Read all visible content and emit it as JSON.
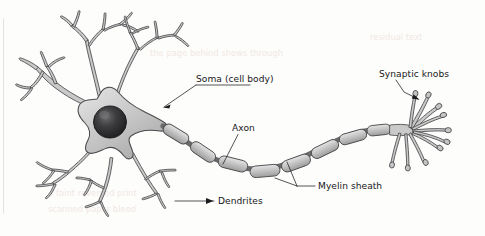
{
  "figure": {
    "background_color": "#fdfdfc",
    "ink_color": "#1b1b1f",
    "structure_fill": "#c9c9c9",
    "structure_outline": "#4a4a4d",
    "nucleus_color": "#262628"
  },
  "labels": {
    "soma": "Soma (cell body)",
    "axon": "Axon",
    "myelin": "Myelin sheath",
    "dendrites": "Dendrites",
    "synaptic_knobs": "Synaptic knobs"
  },
  "parts": [
    {
      "name": "soma",
      "label": "Soma (cell body)",
      "leader": "underline-then-line-down-left",
      "label_x": 196,
      "label_y": 82
    },
    {
      "name": "axon",
      "label": "Axon",
      "leader": "line-down-left",
      "label_x": 232,
      "label_y": 131
    },
    {
      "name": "myelin-sheath",
      "label": "Myelin sheath",
      "leader": "forked-two-prong-left",
      "label_x": 318,
      "label_y": 189
    },
    {
      "name": "dendrites",
      "label": "Dendrites",
      "leader": "arrow-left",
      "label_x": 218,
      "label_y": 204
    },
    {
      "name": "synaptic-knobs",
      "label": "Synaptic knobs",
      "leader": "arrow-down-right",
      "label_x": 379,
      "label_y": 77
    }
  ],
  "ghost_text": [
    {
      "text": "the page behind shows through",
      "x": 150,
      "y": 56
    },
    {
      "text": "faint reversed print",
      "x": 56,
      "y": 196
    },
    {
      "text": "scanned paper bleed",
      "x": 48,
      "y": 212
    },
    {
      "text": "residual text",
      "x": 370,
      "y": 40
    }
  ]
}
